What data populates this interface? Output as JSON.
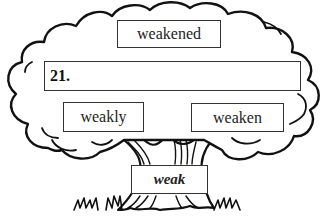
{
  "worksheet": {
    "root_word": "weak",
    "question_number": "21.",
    "answer_value": "",
    "branches": [
      {
        "label": "weakened"
      },
      {
        "label": "weakly"
      },
      {
        "label": "weaken"
      }
    ]
  },
  "colors": {
    "line": "#111111",
    "box_border": "#333333",
    "background": "#ffffff"
  }
}
